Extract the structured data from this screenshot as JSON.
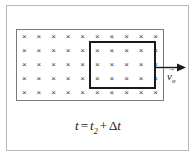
{
  "figure": {
    "type": "physics-diagram",
    "background_color": "#ffffff",
    "frame_color": "#b8b8b8"
  },
  "field_region": {
    "label": "magnetic-field-into-page",
    "symbol": "×",
    "rows": 5,
    "columns": 10,
    "total_marks": 50,
    "border_color": "#7a7a7a",
    "mark_color": "#3a3a3a"
  },
  "loop": {
    "label": "conducting-loop",
    "border_color": "#1a1a1a",
    "border_width_px": 2
  },
  "velocity": {
    "arrow_direction": "right",
    "arrow_color": "#1a1a1a",
    "symbol": "v",
    "vector_accent": "→",
    "subscript": "o"
  },
  "caption": {
    "variable": "t",
    "equals": "=",
    "term1": "t",
    "term1_subscript": "2",
    "plus": "+",
    "delta": "Δ",
    "term2": "t",
    "full_text": "t = t2 + Δt"
  }
}
